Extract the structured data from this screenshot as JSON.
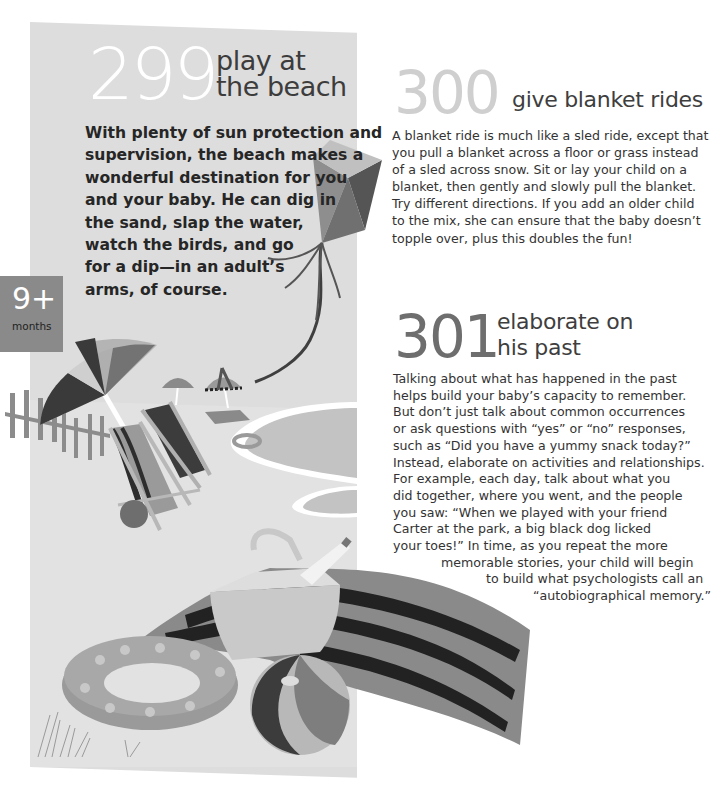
{
  "entries": [
    {
      "number": "299",
      "title_lines": [
        "play at",
        "the beach"
      ],
      "body_lines": [
        "With plenty of sun protection and",
        "supervision, the beach makes a",
        "wonderful destination for you",
        "and your baby. He can dig in",
        "the sand, slap the water,",
        "watch the birds, and go",
        "for a dip—in an adult’s",
        "arms, of course."
      ]
    },
    {
      "number": "300",
      "title_lines": [
        "give blanket rides"
      ],
      "body_lines": [
        "A blanket ride is much like a sled ride, except that",
        "you pull a blanket across a floor or grass instead",
        "of a sled across snow. Sit or lay your child on a",
        "blanket, then gently and slowly pull the blanket.",
        "Try different directions. If you add an older child",
        "to the mix, she can ensure that the baby doesn’t",
        "topple over, plus this doubles the fun!"
      ]
    },
    {
      "number": "301",
      "title_lines": [
        "elaborate on",
        "his past"
      ],
      "body_lines": [
        "Talking about what has happened in the past",
        "helps build your baby’s capacity to remember.",
        "But don’t just talk about common occurrences",
        "or ask questions with “yes” or “no” responses,",
        "such as “Did you have a yummy snack today?”",
        "Instead, elaborate on activities and relationships.",
        "For example, each day, talk about what you",
        "did together, where you went, and the people",
        "you saw: “When we played with your friend",
        "Carter at the park, a big black dog licked",
        "your toes!” In time, as you repeat the more",
        "memorable stories, your child will begin",
        "to build what psychologists call an",
        "“autobiographical memory.”"
      ]
    }
  ],
  "age_badge": {
    "value": "9+",
    "unit": "months"
  },
  "illustration": {
    "objects": [
      "kite",
      "beach-umbrella",
      "fence",
      "deck-chairs",
      "distant-umbrellas",
      "sea",
      "swim-ring",
      "picnic-basket",
      "striped-blanket",
      "inflatable-ring",
      "beach-ball",
      "grass"
    ],
    "colors": {
      "panel": "#dddddd",
      "sand": "#e4e4e4",
      "sea": "#c4c4c4",
      "dark": "#3a3a3a",
      "mid": "#8c8c8c",
      "light": "#b8b8b8"
    }
  }
}
